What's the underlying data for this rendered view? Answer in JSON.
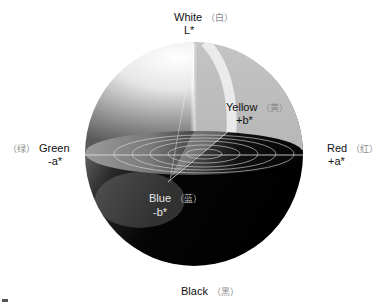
{
  "diagram": {
    "labels": {
      "top": {
        "name": "White",
        "cn": "（白）",
        "axis": "L*"
      },
      "left": {
        "name": "Green",
        "cn": "（绿）",
        "axis": "-a*"
      },
      "right": {
        "name": "Red",
        "cn": "（红）",
        "axis": "+a*"
      },
      "yellow": {
        "name": "Yellow",
        "cn": "（黄）",
        "axis": "+b*"
      },
      "blue": {
        "name": "Blue",
        "cn": "（蓝）",
        "axis": "-b*"
      },
      "bottom": {
        "name": "Black",
        "cn": "（黑）"
      }
    },
    "colors": {
      "background": "#ffffff",
      "sphere_dark": "#0a0a0a",
      "sphere_light": "#f4f4f4",
      "cutaway_gray": "#bdbdbd",
      "ring_lines": "#d8d8d8"
    }
  }
}
